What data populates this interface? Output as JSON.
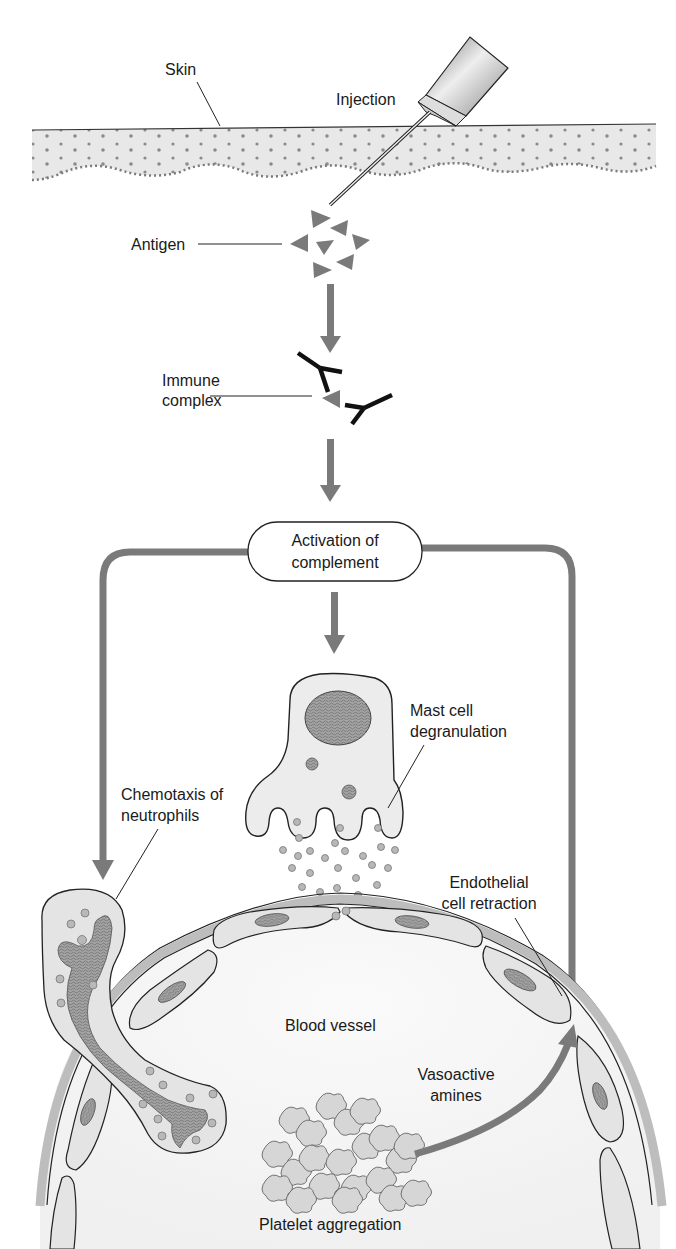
{
  "diagram": {
    "colors": {
      "arrow": "#7a7a7a",
      "antigen": "#7a7a7a",
      "antibody": "#111111",
      "skin_fill": "#e6e6e6",
      "skin_dots": "#8a8a8a",
      "cell_fill": "#ececec",
      "nucleus": "#9a9a9a",
      "vessel_wall": "#bdbdbd",
      "vessel_interior": "#f6f6f6",
      "outline": "#222222"
    },
    "labels": {
      "skin": "Skin",
      "injection": "Injection",
      "antigen": "Antigen",
      "immune_complex_line1": "Immune",
      "immune_complex_line2": "complex",
      "activation_line1": "Activation of",
      "activation_line2": "complement",
      "mast_cell_line1": "Mast cell",
      "mast_cell_line2": "degranulation",
      "chemotaxis_line1": "Chemotaxis of",
      "chemotaxis_line2": "neutrophils",
      "endothelial_line1": "Endothelial",
      "endothelial_line2": "cell retraction",
      "blood_vessel": "Blood vessel",
      "vasoactive_line1": "Vasoactive",
      "vasoactive_line2": "amines",
      "platelet_aggregation": "Platelet aggregation"
    },
    "flow": [
      {
        "from": "Injection",
        "to": "Antigen"
      },
      {
        "from": "Antigen",
        "to": "Immune complex"
      },
      {
        "from": "Immune complex",
        "to": "Activation of complement"
      },
      {
        "from": "Activation of complement",
        "to": "Mast cell degranulation"
      },
      {
        "from": "Activation of complement",
        "to": "Chemotaxis of neutrophils"
      },
      {
        "from": "Activation of complement",
        "to": "Endothelial cell retraction"
      },
      {
        "from": "Platelet aggregation",
        "to": "Endothelial cell retraction",
        "via": "Vasoactive amines"
      }
    ]
  }
}
